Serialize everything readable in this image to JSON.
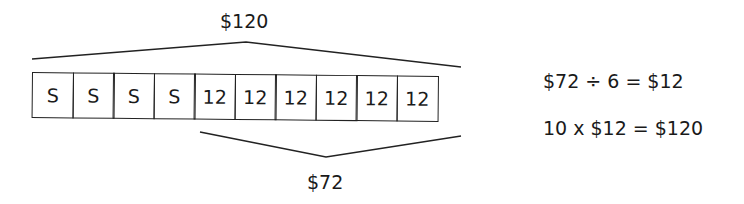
{
  "diagram": {
    "top_label": "$120",
    "bottom_label": "$72",
    "cells": [
      "S",
      "S",
      "S",
      "S",
      "12",
      "12",
      "12",
      "12",
      "12",
      "12"
    ],
    "equations": [
      "$72 ÷ 6 = $12",
      "10 x $12 = $120"
    ],
    "line_color": "#222222"
  }
}
